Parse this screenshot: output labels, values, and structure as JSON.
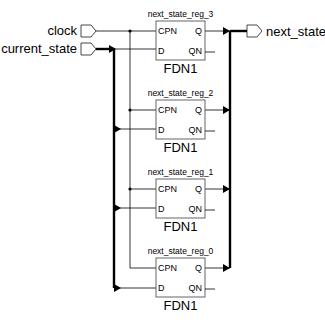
{
  "ports": {
    "clock": {
      "label": "clock",
      "direction": "input"
    },
    "current_state": {
      "label": "current_state",
      "direction": "input",
      "bus": true
    },
    "next_state": {
      "label": "next_state",
      "direction": "output",
      "bus": true
    }
  },
  "instances": [
    {
      "name": "next_state_reg_3",
      "cell": "FDN1",
      "pins": {
        "cpn": "CPN",
        "d": "D",
        "q": "Q",
        "qn": "QN"
      }
    },
    {
      "name": "next_state_reg_2",
      "cell": "FDN1",
      "pins": {
        "cpn": "CPN",
        "d": "D",
        "q": "Q",
        "qn": "QN"
      }
    },
    {
      "name": "next_state_reg_1",
      "cell": "FDN1",
      "pins": {
        "cpn": "CPN",
        "d": "D",
        "q": "Q",
        "qn": "QN"
      }
    },
    {
      "name": "next_state_reg_0",
      "cell": "FDN1",
      "pins": {
        "cpn": "CPN",
        "d": "D",
        "q": "Q",
        "qn": "QN"
      }
    }
  ]
}
